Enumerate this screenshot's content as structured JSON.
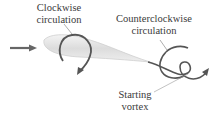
{
  "diagram": {
    "labels": {
      "clockwise": [
        "Clockwise",
        "circulation"
      ],
      "counterclockwise": [
        "Counterclockwise",
        "circulation"
      ],
      "starting_vortex": [
        "Starting",
        "vortex"
      ]
    },
    "elements": {
      "flow_arrow": "right-arrow",
      "airfoil": "airfoil-shape",
      "clockwise_loop": "clockwise-circulation-arrow",
      "vortex_spiral": "starting-vortex-spiral"
    },
    "colors": {
      "line": "#555555",
      "text": "#3a3a3a",
      "airfoil_fill": "#e6e6e6",
      "airfoil_stroke": "#c8c8c8"
    }
  }
}
